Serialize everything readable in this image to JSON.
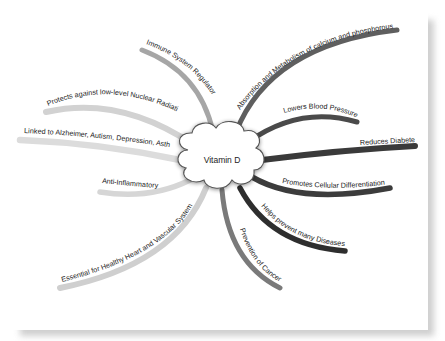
{
  "mindmap": {
    "center": {
      "label": "Vitamin D"
    },
    "branches": [
      {
        "id": "immune",
        "label": "Immune System Regulator",
        "color": "#a6a6a6"
      },
      {
        "id": "absorption",
        "label": "Absorption  and Metabolism of calcium and phosphorous",
        "color": "#5f5f5f"
      },
      {
        "id": "blood-pressure",
        "label": "Lowers Blood Pressure",
        "color": "#4a4a4a"
      },
      {
        "id": "diabetes",
        "label": "Reduces Diabetes",
        "color": "#3a3a3a"
      },
      {
        "id": "cellular",
        "label": "Promotes Cellular Differentiation",
        "color": "#3c3c3c"
      },
      {
        "id": "diseases",
        "label": "Helps prevent many Diseases",
        "color": "#2e2e2e"
      },
      {
        "id": "cancer",
        "label": "Prevention of Cancer",
        "color": "#7a7a7a"
      },
      {
        "id": "heart",
        "label": "Essential for Healthy Heart and Vascular System",
        "color": "#cfcfcf"
      },
      {
        "id": "anti-inflammatory",
        "label": "Anti-Inflammatory",
        "color": "#d6d6d6"
      },
      {
        "id": "alzheimer",
        "label": "Linked to Alzheimer, Autism, Depression, Asthma",
        "color": "#dcdcdc"
      },
      {
        "id": "radiation",
        "label": "Protects against low-level Nuclear Radiation",
        "color": "#d2d2d2"
      }
    ]
  }
}
